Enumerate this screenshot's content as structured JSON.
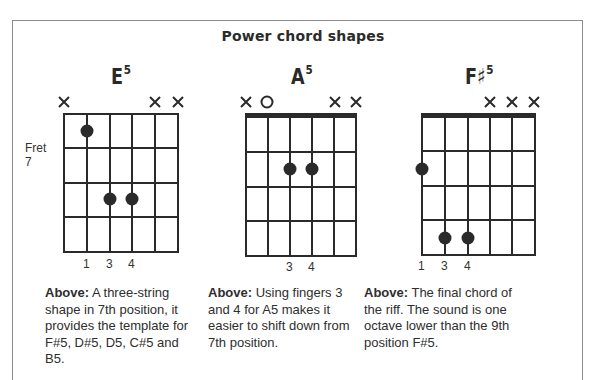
{
  "title": "Power chord shapes",
  "colors": {
    "ink": "#2a2a2a",
    "frame": "#8c8c8c",
    "background": "#ffffff"
  },
  "chords": [
    {
      "name": "E",
      "superscript": "5",
      "position_label": "Fret 7",
      "has_nut": false,
      "string_markers": [
        "x",
        "",
        "",
        "",
        "x",
        "x"
      ],
      "dots": [
        {
          "string": 1,
          "fret": 1
        },
        {
          "string": 3,
          "fret": 3
        },
        {
          "string": 4,
          "fret": 3
        }
      ],
      "finger_labels": [
        "1",
        "3",
        "4"
      ],
      "caption_bold": "Above:",
      "caption_text": " A three-string shape in 7th position, it provides the template for F#5, D#5, D5, C#5 and B5."
    },
    {
      "name": "A",
      "superscript": "5",
      "position_label": "",
      "has_nut": true,
      "string_markers": [
        "x",
        "o",
        "",
        "",
        "x",
        "x"
      ],
      "dots": [
        {
          "string": 3,
          "fret": 2
        },
        {
          "string": 4,
          "fret": 2
        }
      ],
      "finger_labels": [
        "3",
        "4"
      ],
      "caption_bold": "Above:",
      "caption_text": " Using fingers 3 and 4 for A5 makes it easier to shift down from 7th position."
    },
    {
      "name": "F♯",
      "superscript": "5",
      "position_label": "",
      "has_nut": true,
      "string_markers": [
        "",
        "",
        "",
        "x",
        "x",
        "x"
      ],
      "dots": [
        {
          "string": 1,
          "fret": 2
        },
        {
          "string": 2,
          "fret": 4
        },
        {
          "string": 3,
          "fret": 4
        }
      ],
      "finger_labels": [
        "1",
        "3",
        "4"
      ],
      "caption_bold": "Above:",
      "caption_text": " The final chord of the riff. The sound is one octave lower than the 9th position F#5."
    }
  ]
}
